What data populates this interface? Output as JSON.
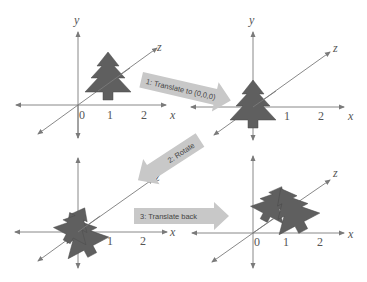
{
  "diagram": {
    "panels": [
      {
        "id": "original",
        "axis_labels": {
          "y": "y",
          "z": "z",
          "x": "x"
        },
        "ticks": [
          "0",
          "1",
          "2"
        ],
        "object": "tree at x=1"
      },
      {
        "id": "translated",
        "axis_labels": {
          "y": "y",
          "z": "z",
          "x": "x"
        },
        "ticks": [
          "1",
          "2"
        ],
        "object": "tree at origin"
      },
      {
        "id": "rotated",
        "axis_labels": {
          "z": "z",
          "x": "x"
        },
        "ticks": [
          "1",
          "2"
        ],
        "object": "rotated tree at origin"
      },
      {
        "id": "translated-back",
        "axis_labels": {
          "z": "z",
          "x": "x"
        },
        "ticks": [
          "0",
          "1",
          "2"
        ],
        "object": "rotated tree at x=1"
      }
    ],
    "steps": [
      {
        "label": "1: Translate to (0,0,0)"
      },
      {
        "label": "2: Rotate"
      },
      {
        "label": "3: Translate back"
      }
    ],
    "colors": {
      "axis": "#7a7a7a",
      "tree": "#5f5f5f",
      "arrow": "#c8c8c8",
      "text": "#555555"
    }
  }
}
